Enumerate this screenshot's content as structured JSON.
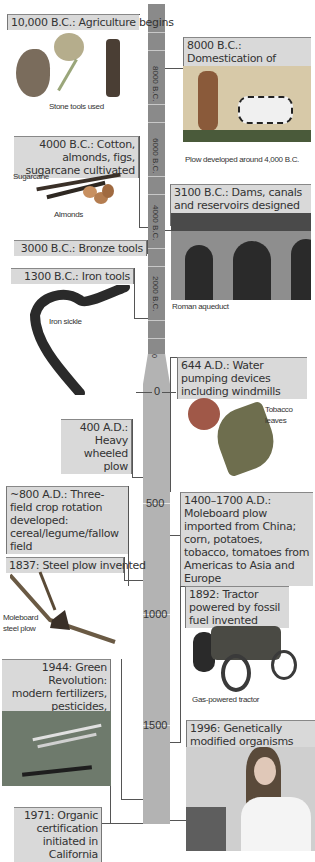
{
  "timeline": {
    "bc_labels": [
      "8000 B.C.",
      "6000 B.C.",
      "4000 B.C.",
      "2000 B.C.",
      "0"
    ],
    "ad_labels": [
      "0",
      "500",
      "1000",
      "1500"
    ],
    "colors": {
      "bc_bar": "#8a8a8a",
      "ad_bar": "#b3b3b3",
      "label_bg": "#d9d9d9"
    }
  },
  "events_left": [
    {
      "text": "10,000 B.C.: Agriculture begins",
      "caption": "Stone tools used"
    },
    {
      "text": "4000 B.C.: Cotton, almonds, figs, sugarcane cultivated",
      "captions": [
        "Sugarcane",
        "Almonds"
      ]
    },
    {
      "text": "3000 B.C.: Bronze tools"
    },
    {
      "text": "1300 B.C.: Iron tools",
      "caption": "Iron sickle"
    },
    {
      "text": "400 A.D.: Heavy wheeled plow"
    },
    {
      "text": "~800 A.D.: Three-field crop rotation developed: cereal/legume/fallow field"
    },
    {
      "text": "1837: Steel plow invented",
      "caption": "Moleboard steel plow"
    },
    {
      "text": "1944: Green Revolution: modern fertilizers, pesticides, herbicides developed"
    },
    {
      "text": "1971: Organic certification initiated in California"
    }
  ],
  "events_right": [
    {
      "text": "8000 B.C.: Domestication of cattle",
      "caption": "Plow developed around 4,000 B.C."
    },
    {
      "text": "3100 B.C.: Dams, canals and reservoirs designed for irrigation",
      "caption": "Roman aqueduct"
    },
    {
      "text": "644 A.D.: Water pumping devices including windmills",
      "caption": "Tobacco leaves"
    },
    {
      "text": "1400–1700 A.D.: Moleboard plow imported from China; corn, potatoes, tobacco, tomatoes from Americas to Asia and Europe"
    },
    {
      "text": "1892: Tractor powered by fossil fuel invented",
      "caption": "Gas-powered tractor"
    },
    {
      "text": "1996: Genetically modified organisms introduced"
    }
  ]
}
